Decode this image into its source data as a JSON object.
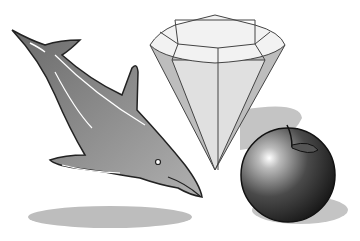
{
  "scene": {
    "objects": [
      {
        "name": "dolphin",
        "color": "#8a8a8a"
      },
      {
        "name": "diamond",
        "color": "#d8d8d8"
      },
      {
        "name": "apple",
        "color": "#2a2a2a"
      }
    ],
    "background": "#ffffff"
  }
}
